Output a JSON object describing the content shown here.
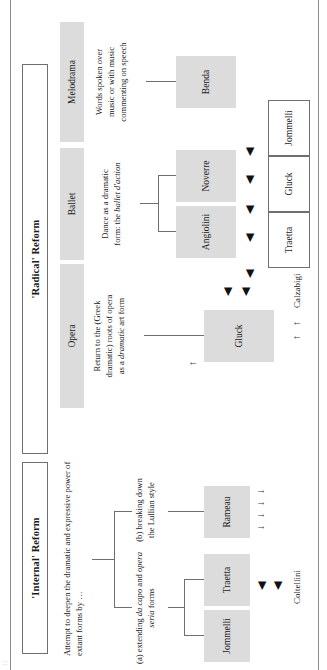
{
  "page": {
    "running_head": "11",
    "orientation": "landscape-diagram-rotated-90ccw"
  },
  "categories": [
    {
      "id": "internal",
      "label": "'Internal' Reform"
    },
    {
      "id": "radical",
      "label": "'Radical' Reform"
    }
  ],
  "internal_reform": {
    "summary": "Attempt to deepen the dramatic and expressive power of extant forms by …",
    "branches": [
      {
        "id": "branch-a",
        "label_plain_1": "(a) extending ",
        "label_italic_1": "da capo",
        "label_plain_2": " and ",
        "label_italic_2": "opera seria",
        "label_plain_3": " forms",
        "label_flat": "(a) extending da capo and opera seria forms",
        "composers": [
          "Jommelli",
          "Traetta"
        ]
      },
      {
        "id": "branch-b",
        "label_flat": "(b) breaking down the Lullian style",
        "label_line_1": "(b) breaking down",
        "label_line_2": "the Lullian style",
        "composers": [
          "Rameau"
        ]
      }
    ],
    "librettist": "Coltellini"
  },
  "radical_reform": {
    "genres": [
      {
        "id": "opera",
        "title": "Opera",
        "description_line_1": "Return to the (Greek",
        "description_line_2": "dramatic) roots of opera",
        "description_line_3_plain_a": "as a ",
        "description_line_3_italic": "dramatic",
        "description_line_3_plain_b": " art form",
        "description_flat": "Return to the (Greek dramatic) roots of opera as a dramatic art form",
        "composers": [
          "Gluck"
        ]
      },
      {
        "id": "ballet",
        "title": "Ballet",
        "description_line_1": "Dance as a dramatic",
        "description_line_2_plain": "form: the ",
        "description_line_2_italic": "ballet d'action",
        "description_flat": "Dance as a dramatic form: the ballet d'action",
        "choreographers": [
          "Angiolini",
          "Noverre"
        ]
      },
      {
        "id": "melodrama",
        "title": "Melodrama",
        "description_line_1": "Words spoken over",
        "description_line_2": "music or with music",
        "description_line_3": "commenting on speech",
        "description_flat": "Words spoken over music or with music commenting on speech",
        "composers": [
          "Benda"
        ]
      }
    ],
    "librettist": "Calzabigi",
    "collaboration_boxes": [
      "Traetta",
      "Gluck",
      "Jommelli"
    ]
  },
  "glyphs": {
    "arrow_solid": "◀",
    "arrow_thin_up": "↑",
    "arrow_thin_down": "↓"
  },
  "colors": {
    "plate_fill": "#dcdcdc",
    "line": "#6f6f6f",
    "text": "#1a1a1a",
    "page": "#ffffff"
  }
}
